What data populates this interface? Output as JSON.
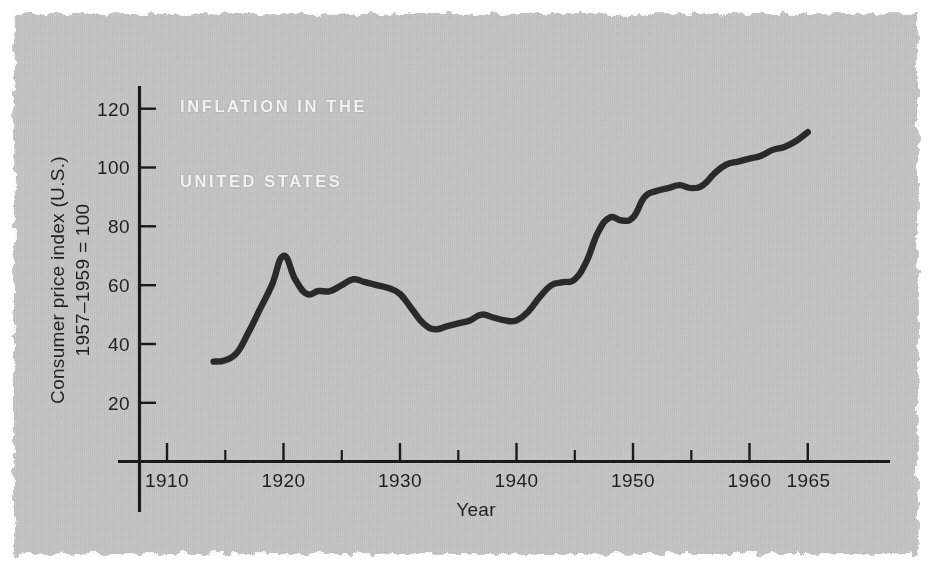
{
  "figure": {
    "title_line1": "INFLATION IN THE",
    "title_line2": "UNITED STATES",
    "paper_color": "#c6c6c6",
    "ink_color": "#2a2a2a",
    "title_color": "#f2f2f2",
    "background_color": "#ffffff"
  },
  "chart_data": {
    "type": "line",
    "title": "INFLATION IN THE UNITED STATES",
    "xlabel": "Year",
    "ylabel": "Consumer price index (U.S.) 1957-1959 = 100",
    "ylabel_line1": "Consumer price index (U.S.)",
    "ylabel_line2": "1957–1959 = 100",
    "xlim": [
      1905,
      1968
    ],
    "ylim": [
      0,
      130
    ],
    "xticks": [
      1910,
      1920,
      1930,
      1940,
      1950,
      1960,
      1965
    ],
    "xtick_labels": [
      "1910",
      "1920",
      "1930",
      "1940",
      "1950",
      "1960",
      "1965"
    ],
    "xticks_minor": [
      1915,
      1925,
      1935,
      1945,
      1955
    ],
    "yticks": [
      20,
      40,
      60,
      80,
      100,
      120
    ],
    "ytick_labels": [
      "20",
      "40",
      "60",
      "80",
      "100",
      "120"
    ],
    "grid": false,
    "legend": null,
    "series": [
      {
        "name": "Consumer price index (U.S.), 1957-1959 = 100",
        "x": [
          1914,
          1915,
          1916,
          1917,
          1918,
          1919,
          1920,
          1921,
          1922,
          1923,
          1924,
          1925,
          1926,
          1927,
          1928,
          1929,
          1930,
          1931,
          1932,
          1933,
          1934,
          1935,
          1936,
          1937,
          1938,
          1939,
          1940,
          1941,
          1942,
          1943,
          1944,
          1945,
          1946,
          1947,
          1948,
          1949,
          1950,
          1951,
          1952,
          1953,
          1954,
          1955,
          1956,
          1957,
          1958,
          1959,
          1960,
          1961,
          1962,
          1963,
          1964,
          1965
        ],
        "values": [
          34,
          34.5,
          37,
          44,
          52,
          60,
          70,
          62,
          57,
          58,
          58,
          60,
          62,
          61,
          60,
          59,
          57,
          52,
          47,
          45,
          46,
          47,
          48,
          50,
          49,
          48,
          48,
          51,
          56,
          60,
          61,
          62,
          68,
          78,
          83,
          82,
          83,
          90,
          92,
          93,
          94,
          93,
          94,
          98,
          101,
          102,
          103,
          104,
          106,
          107,
          109,
          112
        ]
      }
    ]
  }
}
